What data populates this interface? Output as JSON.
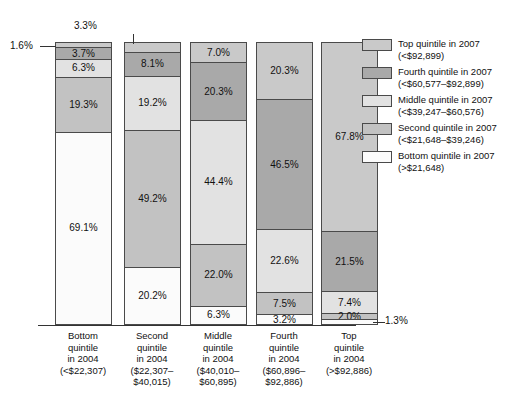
{
  "chart_data": {
    "type": "bar",
    "subtype": "stacked-percent-column",
    "title": "",
    "xlabel": "",
    "ylabel": "",
    "ylim": [
      0,
      100
    ],
    "grid": false,
    "legend_position": "right",
    "categories": [
      "Bottom quintile in 2004 (<$22,307)",
      "Second quintile in 2004 ($22,307–$40,015)",
      "Middle quintile in 2004 ($40,010–$60,895)",
      "Fourth quintile in 2004 ($60,896–$92,886)",
      "Top quintile in 2004 (>$92,886)"
    ],
    "series": [
      {
        "name": "Top quintile in 2007 (<$92,899)",
        "values": [
          1.6,
          3.3,
          7.0,
          20.3,
          67.8
        ]
      },
      {
        "name": "Fourth quintile in 2007 (<$60,577–$92,899)",
        "values": [
          3.7,
          8.1,
          20.3,
          46.5,
          21.5
        ]
      },
      {
        "name": "Middle quintile in 2007 (<$39,247–$60,576)",
        "values": [
          6.3,
          19.2,
          44.4,
          22.6,
          7.4
        ]
      },
      {
        "name": "Second quintile in 2007 (<$21,648–$39,246)",
        "values": [
          19.3,
          49.2,
          22.0,
          7.5,
          2.0
        ]
      },
      {
        "name": "Bottom quintile in 2007 (>$21,648)",
        "values": [
          69.1,
          20.2,
          6.3,
          3.2,
          1.3
        ]
      }
    ],
    "colors": {
      "top_quintile_2007": "#c9c9c9",
      "fourth_quintile_2007": "#a9a9a9",
      "middle_quintile_2007": "#e2e2e2",
      "second_quintile_2007": "#c2c2c2",
      "bottom_quintile_2007": "#fbfbfb",
      "outline": "#4a4a4a",
      "text": "#111111"
    }
  },
  "bars": [
    {
      "key": "bottom-2004",
      "segments": [
        {
          "label": "1.6%",
          "value": 1.6,
          "fill": "#c9c9c9",
          "label_placement": "callout-left"
        },
        {
          "label": "3.7%",
          "value": 3.7,
          "fill": "#a9a9a9",
          "label_placement": "inside"
        },
        {
          "label": "6.3%",
          "value": 6.3,
          "fill": "#e2e2e2",
          "label_placement": "inside"
        },
        {
          "label": "19.3%",
          "value": 19.3,
          "fill": "#c2c2c2",
          "label_placement": "inside"
        },
        {
          "label": "69.1%",
          "value": 69.1,
          "fill": "#fbfbfb",
          "label_placement": "inside"
        }
      ]
    },
    {
      "key": "second-2004",
      "segments": [
        {
          "label": "3.3%",
          "value": 3.3,
          "fill": "#c9c9c9",
          "label_placement": "callout-top"
        },
        {
          "label": "8.1%",
          "value": 8.1,
          "fill": "#a9a9a9",
          "label_placement": "inside"
        },
        {
          "label": "19.2%",
          "value": 19.2,
          "fill": "#e2e2e2",
          "label_placement": "inside"
        },
        {
          "label": "49.2%",
          "value": 49.2,
          "fill": "#c2c2c2",
          "label_placement": "inside"
        },
        {
          "label": "20.2%",
          "value": 20.2,
          "fill": "#fbfbfb",
          "label_placement": "inside"
        }
      ]
    },
    {
      "key": "middle-2004",
      "segments": [
        {
          "label": "7.0%",
          "value": 7.0,
          "fill": "#c9c9c9",
          "label_placement": "inside"
        },
        {
          "label": "20.3%",
          "value": 20.3,
          "fill": "#a9a9a9",
          "label_placement": "inside"
        },
        {
          "label": "44.4%",
          "value": 44.4,
          "fill": "#e2e2e2",
          "label_placement": "inside"
        },
        {
          "label": "22.0%",
          "value": 22.0,
          "fill": "#c2c2c2",
          "label_placement": "inside"
        },
        {
          "label": "6.3%",
          "value": 6.3,
          "fill": "#fbfbfb",
          "label_placement": "inside"
        }
      ]
    },
    {
      "key": "fourth-2004",
      "segments": [
        {
          "label": "20.3%",
          "value": 20.3,
          "fill": "#c9c9c9",
          "label_placement": "inside"
        },
        {
          "label": "46.5%",
          "value": 46.5,
          "fill": "#a9a9a9",
          "label_placement": "inside"
        },
        {
          "label": "22.6%",
          "value": 22.6,
          "fill": "#e2e2e2",
          "label_placement": "inside"
        },
        {
          "label": "7.5%",
          "value": 7.5,
          "fill": "#c2c2c2",
          "label_placement": "inside"
        },
        {
          "label": "3.2%",
          "value": 3.2,
          "fill": "#fbfbfb",
          "label_placement": "inside"
        }
      ]
    },
    {
      "key": "top-2004",
      "segments": [
        {
          "label": "67.8%",
          "value": 67.8,
          "fill": "#c9c9c9",
          "label_placement": "inside"
        },
        {
          "label": "21.5%",
          "value": 21.5,
          "fill": "#a9a9a9",
          "label_placement": "inside"
        },
        {
          "label": "7.4%",
          "value": 7.4,
          "fill": "#e2e2e2",
          "label_placement": "inside"
        },
        {
          "label": "2.0%",
          "value": 2.0,
          "fill": "#c2c2c2",
          "label_placement": "inside"
        },
        {
          "label": "1.3%",
          "value": 1.3,
          "fill": "#fbfbfb",
          "label_placement": "callout-right"
        }
      ]
    }
  ],
  "callouts": {
    "left_1_6": "1.6%",
    "top_3_3": "3.3%",
    "right_1_3": "1.3%"
  },
  "xaxis": {
    "labels": [
      {
        "l1": "Bottom",
        "l2": "quintile",
        "l3": "in 2004",
        "l4": "(<$22,307)",
        "l5": ""
      },
      {
        "l1": "Second",
        "l2": "quintile",
        "l3": "in 2004",
        "l4": "($22,307–",
        "l5": "$40,015)"
      },
      {
        "l1": "Middle",
        "l2": "quintile",
        "l3": "in 2004",
        "l4": "($40,010–",
        "l5": "$60,895)"
      },
      {
        "l1": "Fourth",
        "l2": "quintile",
        "l3": "in 2004",
        "l4": "($60,896–",
        "l5": "$92,886)"
      },
      {
        "l1": "Top",
        "l2": "quintile",
        "l3": "in 2004",
        "l4": "(>$92,886)",
        "l5": ""
      }
    ]
  },
  "legend": {
    "items": [
      {
        "line1": "Top quintile in 2007",
        "line2": "(<$92,899)",
        "color": "#c9c9c9"
      },
      {
        "line1": "Fourth quintile in 2007",
        "line2": "(<$60,577–$92,899)",
        "color": "#a9a9a9"
      },
      {
        "line1": "Middle quintile in 2007",
        "line2": "(<$39,247–$60,576)",
        "color": "#e2e2e2"
      },
      {
        "line1": "Second quintile in 2007",
        "line2": "(<$21,648–$39,246)",
        "color": "#c2c2c2"
      },
      {
        "line1": "Bottom quintile in 2007",
        "line2": "(>$21,648)",
        "color": "#fbfbfb"
      }
    ]
  }
}
